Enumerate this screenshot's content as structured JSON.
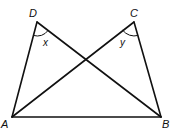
{
  "diagram": {
    "points": {
      "A": {
        "label": "A",
        "x": 12,
        "y": 117
      },
      "B": {
        "label": "B",
        "x": 161,
        "y": 117
      },
      "C": {
        "label": "C",
        "x": 134,
        "y": 22
      },
      "D": {
        "label": "D",
        "x": 37,
        "y": 22
      }
    },
    "segments": [
      "AB",
      "AD",
      "AC",
      "BD",
      "BC"
    ],
    "angles": {
      "x": {
        "label": "x",
        "vertex": "D"
      },
      "y": {
        "label": "y",
        "vertex": "C"
      }
    },
    "stroke_color": "#111111"
  }
}
